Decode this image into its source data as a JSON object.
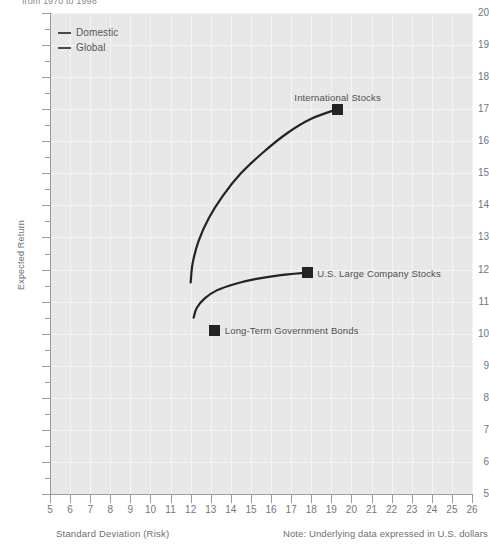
{
  "caption_top": "from 1970 to 1998",
  "axis_titles": {
    "x": "Standard Deviation (Risk)",
    "y": "Expected Return"
  },
  "note": "Note: Underlying data expressed in U.S. dollars",
  "legend": {
    "items": [
      {
        "label": "Domestic",
        "color": "#4a4a4a"
      },
      {
        "label": "Global",
        "color": "#4a4a4a"
      }
    ]
  },
  "chart_data": {
    "type": "line",
    "title": "",
    "subtitle": "from 1970 to 1998",
    "xlabel": "Standard Deviation (Risk)",
    "ylabel": "Expected Return",
    "xlim": [
      5,
      26
    ],
    "ylim": [
      5,
      20
    ],
    "xticks": [
      5,
      6,
      7,
      8,
      9,
      10,
      11,
      12,
      13,
      14,
      15,
      16,
      17,
      18,
      19,
      20,
      21,
      22,
      23,
      24,
      25,
      26
    ],
    "yticks": [
      5,
      6,
      7,
      8,
      9,
      10,
      11,
      12,
      13,
      14,
      15,
      16,
      17,
      18,
      19,
      20
    ],
    "y_minor_ticks": true,
    "grid": true,
    "legend_position": "top-left",
    "annotation": "Note: Underlying data expressed in U.S. dollars",
    "series": [
      {
        "name": "Domestic",
        "color": "#232323",
        "points": [
          {
            "x": 12.0,
            "y": 11.6
          },
          {
            "x": 12.1,
            "y": 12.2
          },
          {
            "x": 12.4,
            "y": 12.9
          },
          {
            "x": 12.9,
            "y": 13.6
          },
          {
            "x": 13.6,
            "y": 14.3
          },
          {
            "x": 14.5,
            "y": 15.0
          },
          {
            "x": 15.6,
            "y": 15.65
          },
          {
            "x": 16.8,
            "y": 16.25
          },
          {
            "x": 18.0,
            "y": 16.7
          },
          {
            "x": 19.3,
            "y": 17.0
          }
        ]
      },
      {
        "name": "Global",
        "color": "#232323",
        "points": [
          {
            "x": 12.15,
            "y": 10.5
          },
          {
            "x": 12.3,
            "y": 10.8
          },
          {
            "x": 12.7,
            "y": 11.1
          },
          {
            "x": 13.3,
            "y": 11.35
          },
          {
            "x": 14.2,
            "y": 11.55
          },
          {
            "x": 15.2,
            "y": 11.7
          },
          {
            "x": 16.4,
            "y": 11.82
          },
          {
            "x": 17.8,
            "y": 11.9
          }
        ]
      }
    ],
    "markers": [
      {
        "label": "International Stocks",
        "x": 19.3,
        "y": 17.0,
        "label_dx": -43,
        "label_dy": -17
      },
      {
        "label": "U.S. Large Company Stocks",
        "x": 17.8,
        "y": 11.9,
        "label_dx": 10,
        "label_dy": -5
      },
      {
        "label": "Long-Term Government Bonds",
        "x": 13.2,
        "y": 10.1,
        "label_dx": 10,
        "label_dy": -5
      }
    ]
  }
}
